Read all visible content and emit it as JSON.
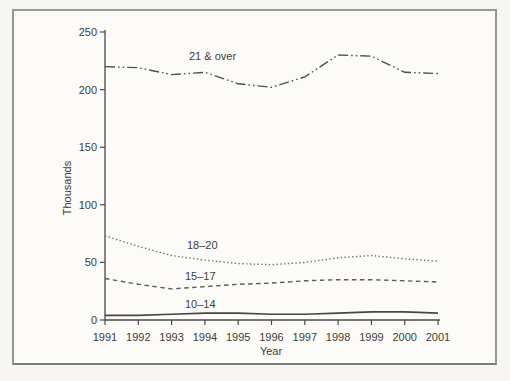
{
  "chart_data": {
    "type": "line",
    "title": "",
    "xlabel": "Year",
    "ylabel": "Thousands",
    "x": [
      "1991",
      "1992",
      "1993",
      "1994",
      "1995",
      "1996",
      "1997",
      "1998",
      "1999",
      "2000",
      "2001"
    ],
    "y_ticks": [
      0,
      50,
      100,
      150,
      200,
      250
    ],
    "ylim": [
      0,
      250
    ],
    "grid": false,
    "legend": "inline-labels",
    "axis_color": "#4a4a4a",
    "series": [
      {
        "name": "21 & over",
        "line_style": "dash-dot-dot",
        "color": "#4f4f4f",
        "values": [
          220,
          219,
          213,
          215,
          205,
          202,
          211,
          230,
          229,
          215,
          214
        ]
      },
      {
        "name": "18–20",
        "line_style": "dotted",
        "color": "#6e6e6e",
        "values": [
          73,
          64,
          56,
          52,
          49,
          48,
          50,
          54,
          56,
          53,
          51
        ]
      },
      {
        "name": "15–17",
        "line_style": "dashed",
        "color": "#5c5c5c",
        "values": [
          36,
          31,
          27,
          29,
          31,
          32,
          34,
          35,
          35,
          34,
          33
        ]
      },
      {
        "name": "10–14",
        "line_style": "solid",
        "color": "#474747",
        "values": [
          4,
          4,
          5,
          6,
          6,
          5,
          5,
          6,
          7,
          7,
          6
        ]
      }
    ]
  }
}
